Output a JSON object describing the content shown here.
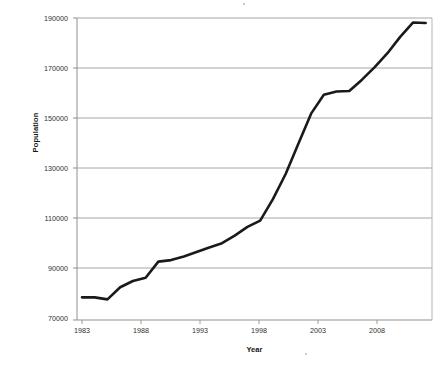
{
  "chart_data": {
    "type": "line",
    "title": "",
    "xlabel": "Year",
    "ylabel": "Population",
    "xlim": [
      1983,
      2010.5
    ],
    "ylim": [
      70000,
      190000
    ],
    "grid": "horizontal",
    "legend": "none",
    "line_color": "#1a1a1a",
    "gridline_color": "#a6a6a6",
    "border_color": "#9a9a9a",
    "y_ticks": [
      70000,
      90000,
      110000,
      130000,
      150000,
      170000,
      190000
    ],
    "y_tick_labels": [
      "70000",
      "90000",
      "110000",
      "130000",
      "150000",
      "170000",
      "190000"
    ],
    "x_ticks": [
      1983,
      1988,
      1993,
      1998,
      2003,
      2008
    ],
    "x_tick_labels": [
      "1983",
      "1988",
      "1993",
      "1998",
      "2003",
      "2008"
    ],
    "series": [
      {
        "name": "Population",
        "x": [
          1983,
          1984,
          1985,
          1986,
          1987,
          1988,
          1989,
          1990,
          1991,
          1992,
          1993,
          1994,
          1995,
          1996,
          1997,
          1998,
          1999,
          2000,
          2001,
          2002,
          2003,
          2004,
          2005,
          2006,
          2007,
          2008,
          2009,
          2010
        ],
        "values": [
          79000,
          79000,
          78200,
          83000,
          85500,
          86800,
          93200,
          93800,
          95200,
          97000,
          98800,
          100500,
          103500,
          107000,
          109500,
          118000,
          128000,
          140000,
          152000,
          159500,
          160800,
          161000,
          165500,
          170500,
          176000,
          182500,
          188200,
          188000
        ]
      }
    ]
  },
  "axis_titles": {
    "x": "Year",
    "y": "Population"
  }
}
